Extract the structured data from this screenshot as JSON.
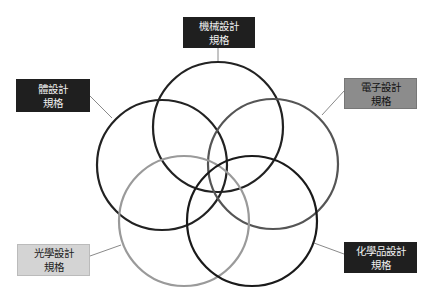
{
  "diagram": {
    "type": "five-circle-venn",
    "sets": [
      {
        "id": "mechanical",
        "label_line1": "機械設計",
        "label_line2": "規格",
        "circle": {
          "cx": 218,
          "cy": 127,
          "r": 65,
          "stroke": "#222222"
        },
        "box": {
          "x": 183,
          "y": 17,
          "w": 72,
          "h": 31,
          "style": "dark"
        },
        "leader": {
          "x1": 218,
          "y1": 48,
          "x2": 218,
          "y2": 62
        }
      },
      {
        "id": "body",
        "label_line1": "體設計",
        "label_line2": "規格",
        "circle": {
          "cx": 162,
          "cy": 165,
          "r": 65,
          "stroke": "#222222"
        },
        "box": {
          "x": 16,
          "y": 79,
          "w": 74,
          "h": 33,
          "style": "dark"
        },
        "leader": {
          "x1": 90,
          "y1": 96,
          "x2": 112,
          "y2": 118
        }
      },
      {
        "id": "electronic",
        "label_line1": "電子設計",
        "label_line2": "規格",
        "circle": {
          "cx": 273,
          "cy": 164,
          "r": 65,
          "stroke": "#555555"
        },
        "box": {
          "x": 344,
          "y": 78,
          "w": 73,
          "h": 31,
          "style": "mid"
        },
        "leader": {
          "x1": 344,
          "y1": 91,
          "x2": 322,
          "y2": 115
        }
      },
      {
        "id": "optical",
        "label_line1": "光學設計",
        "label_line2": "規格",
        "circle": {
          "cx": 184,
          "cy": 221,
          "r": 65,
          "stroke": "#9a9a9a"
        },
        "box": {
          "x": 17,
          "y": 244,
          "w": 73,
          "h": 32,
          "style": "light"
        },
        "leader": {
          "x1": 90,
          "y1": 256,
          "x2": 121,
          "y2": 245
        }
      },
      {
        "id": "chemical",
        "label_line1": "化學品設計",
        "label_line2": "規格",
        "circle": {
          "cx": 252,
          "cy": 221,
          "r": 65,
          "stroke": "#1a1a1a"
        },
        "box": {
          "x": 344,
          "y": 242,
          "w": 73,
          "h": 31,
          "style": "dark"
        },
        "leader": {
          "x1": 344,
          "y1": 254,
          "x2": 314,
          "y2": 243
        }
      }
    ]
  }
}
